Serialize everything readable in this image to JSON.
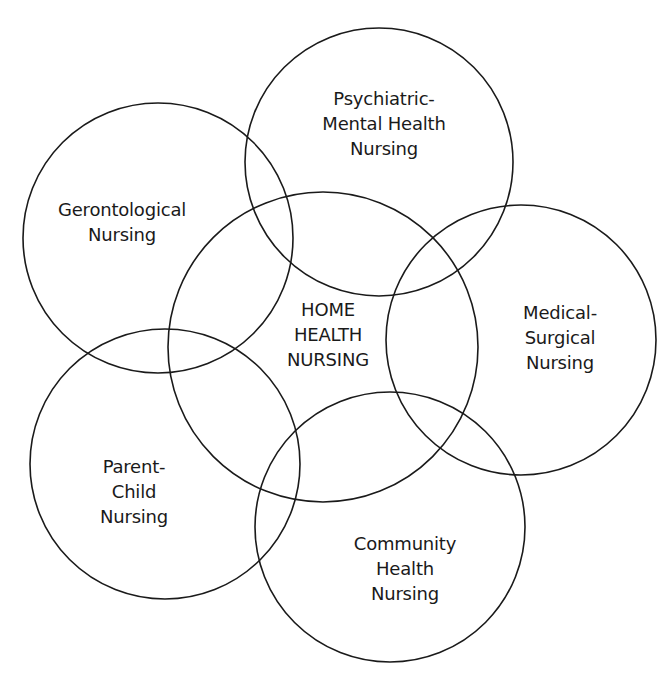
{
  "diagram": {
    "type": "overlapping-circles",
    "stroke_color": "#1a1a1a",
    "text_color": "#1a1a1a",
    "background": "#ffffff",
    "center": {
      "id": "home-health",
      "lines": [
        "HOME",
        "HEALTH",
        "NURSING"
      ],
      "cx": 323,
      "cy": 347,
      "r": 155,
      "label_x": 328,
      "label_top": 297
    },
    "satellites": [
      {
        "id": "gerontological",
        "lines": [
          "Gerontological",
          "Nursing"
        ],
        "cx": 158,
        "cy": 238,
        "r": 135,
        "label_x": 122,
        "label_top": 197
      },
      {
        "id": "psychiatric-mental-health",
        "lines": [
          "Psychiatric-",
          "Mental Health",
          "Nursing"
        ],
        "cx": 379,
        "cy": 162,
        "r": 134,
        "label_x": 384,
        "label_top": 86
      },
      {
        "id": "medical-surgical",
        "lines": [
          "Medical-",
          "Surgical",
          "Nursing"
        ],
        "cx": 521,
        "cy": 340,
        "r": 135,
        "label_x": 560,
        "label_top": 300
      },
      {
        "id": "parent-child",
        "lines": [
          "Parent-",
          "Child",
          "Nursing"
        ],
        "cx": 165,
        "cy": 464,
        "r": 135,
        "label_x": 134,
        "label_top": 454
      },
      {
        "id": "community-health",
        "lines": [
          "Community",
          "Health",
          "Nursing"
        ],
        "cx": 390,
        "cy": 527,
        "r": 135,
        "label_x": 405,
        "label_top": 531
      }
    ]
  }
}
